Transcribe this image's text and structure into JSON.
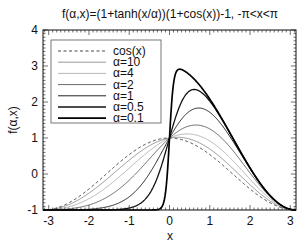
{
  "chart_data": {
    "type": "line",
    "title": "f(α,x)=(1+tanh(x/α))(1+cos(x))-1,  -π<x<π",
    "xlabel": "x",
    "ylabel": "f(α,x)",
    "xlim": [
      -3.14159,
      3.14159
    ],
    "ylim": [
      -1,
      4
    ],
    "xticks": [
      -3,
      -2,
      -1,
      0,
      1,
      2,
      3
    ],
    "xtick_labels": [
      "-3",
      "-2",
      "-1",
      "0",
      "1",
      "2",
      "3"
    ],
    "yticks": [
      -1,
      0,
      1,
      2,
      3,
      4
    ],
    "ytick_labels": [
      "-1",
      "0",
      "1",
      "2",
      "3",
      "4"
    ],
    "grid": false,
    "legend_position": "upper left",
    "function": "(1+tanh(x/alpha))(1+cos(x))-1",
    "series": [
      {
        "name": "cos(x)",
        "kind": "cos",
        "style": "dashed",
        "width": 0.9,
        "color": "#333333"
      },
      {
        "name": "α=10",
        "alpha": 10,
        "style": "solid",
        "width": 0.6,
        "color": "#555555"
      },
      {
        "name": "α=4",
        "alpha": 4,
        "style": "solid",
        "width": 0.6,
        "color": "#888888"
      },
      {
        "name": "α=2",
        "alpha": 2,
        "style": "solid",
        "width": 0.8,
        "color": "#444444"
      },
      {
        "name": "α=1",
        "alpha": 1,
        "style": "solid",
        "width": 1.0,
        "color": "#222222"
      },
      {
        "name": "α=0.5",
        "alpha": 0.5,
        "style": "solid",
        "width": 1.3,
        "color": "#111111"
      },
      {
        "name": "α=0.1",
        "alpha": 0.1,
        "style": "solid",
        "width": 1.7,
        "color": "#000000"
      }
    ],
    "sample_points": {
      "x": [
        -3,
        -2,
        -1,
        0,
        0.5,
        1,
        2,
        3
      ],
      "alpha_0.1_peak": {
        "x": 0.3,
        "y": 2.9
      }
    }
  },
  "legend": {
    "items": [
      "cos(x)",
      "α=10",
      "α=4",
      "α=2",
      "α=1",
      "α=0.5",
      "α=0.1"
    ]
  }
}
